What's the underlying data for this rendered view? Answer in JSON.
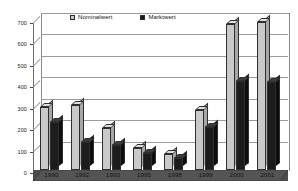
{
  "chart_data": {
    "type": "bar",
    "title": "",
    "xlabel": "",
    "ylabel": "",
    "categories": [
      "1990",
      "1992",
      "1993",
      "1995",
      "1998",
      "1999",
      "2000",
      "2001"
    ],
    "series": [
      {
        "name": "Nominalwert",
        "color": "#c9c9c9",
        "values": [
          295,
          305,
          195,
          105,
          75,
          280,
          680,
          690
        ]
      },
      {
        "name": "Marktwert",
        "color": "#1a1a1a",
        "values": [
          225,
          130,
          115,
          80,
          55,
          200,
          415,
          410
        ]
      }
    ],
    "ylim": [
      0,
      700
    ],
    "yticks": [
      0,
      100,
      200,
      300,
      400,
      500,
      600,
      700
    ],
    "ytick_labels": [
      "0",
      "100",
      "200",
      "300",
      "400",
      "500",
      "600",
      "700"
    ],
    "grid": true,
    "legend_position": "top-center",
    "style": "3d-column"
  },
  "legend": {
    "items": [
      {
        "label": "Nominalwert"
      },
      {
        "label": "Marktwert"
      }
    ]
  }
}
